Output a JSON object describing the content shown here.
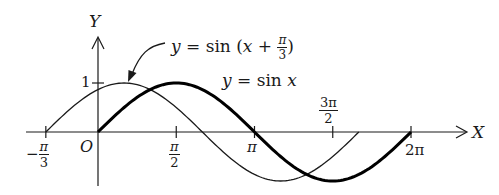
{
  "axes": {
    "x_label": "X",
    "y_label": "Y",
    "origin_label": "O",
    "y_tick_label": "1"
  },
  "x_ticks": [
    {
      "id": "neg-pi-over-3",
      "sign": "−",
      "num": "π",
      "den": "3"
    },
    {
      "id": "pi-over-2",
      "num": "π",
      "den": "2"
    },
    {
      "id": "pi",
      "text": "π"
    },
    {
      "id": "three-pi-over-2",
      "num": "3π",
      "den": "2"
    },
    {
      "id": "two-pi",
      "text": "2π"
    }
  ],
  "curves": {
    "shifted": {
      "label_lhs": "y",
      "label_eq": " = sin (",
      "label_var": "x",
      "label_plus": " + ",
      "label_frac_num": "π",
      "label_frac_den": "3",
      "label_close": ")",
      "stroke": "#1a1a1a",
      "weight": "thin"
    },
    "base": {
      "label_lhs": "y",
      "label_eq": " = sin ",
      "label_var": "x",
      "stroke": "#000000",
      "weight": "bold"
    }
  },
  "chart_data": {
    "type": "line",
    "title": "",
    "xlabel": "X",
    "ylabel": "Y",
    "x_tick_labels": [
      "-π/3",
      "π/2",
      "π",
      "3π/2",
      "2π"
    ],
    "x_tick_values": [
      -1.0472,
      1.5708,
      3.1416,
      4.7124,
      6.2832
    ],
    "y_tick_labels": [
      "1"
    ],
    "y_tick_values": [
      1
    ],
    "xlim": [
      -1.6,
      7.2
    ],
    "ylim": [
      -1.1,
      1.1
    ],
    "grid": false,
    "series": [
      {
        "name": "y = sin(x + π/3)",
        "style": "thin",
        "domain": [
          -1.0472,
          5.236
        ],
        "x": [
          -1.0472,
          -0.5236,
          0,
          0.5236,
          1.0472,
          1.5708,
          2.0944,
          2.618,
          3.1416,
          3.6652,
          4.1888,
          4.7124,
          5.236
        ],
        "y": [
          0,
          0.5,
          0.866,
          1,
          0.866,
          0.5,
          0,
          -0.5,
          -0.866,
          -1,
          -0.866,
          -0.5,
          0
        ]
      },
      {
        "name": "y = sin x",
        "style": "bold",
        "domain": [
          0,
          6.2832
        ],
        "x": [
          0,
          0.5236,
          1.0472,
          1.5708,
          2.0944,
          2.618,
          3.1416,
          3.6652,
          4.1888,
          4.7124,
          5.236,
          5.7596,
          6.2832
        ],
        "y": [
          0,
          0.5,
          0.866,
          1,
          0.866,
          0.5,
          0,
          -0.5,
          -0.866,
          -1,
          -0.866,
          -0.5,
          0
        ]
      }
    ],
    "annotations": [
      {
        "text": "y = sin (x + π/3)",
        "arrow_to": "peak of shifted curve at x = π/6"
      },
      {
        "text": "y = sin x",
        "position": "right of base curve peak"
      }
    ]
  }
}
